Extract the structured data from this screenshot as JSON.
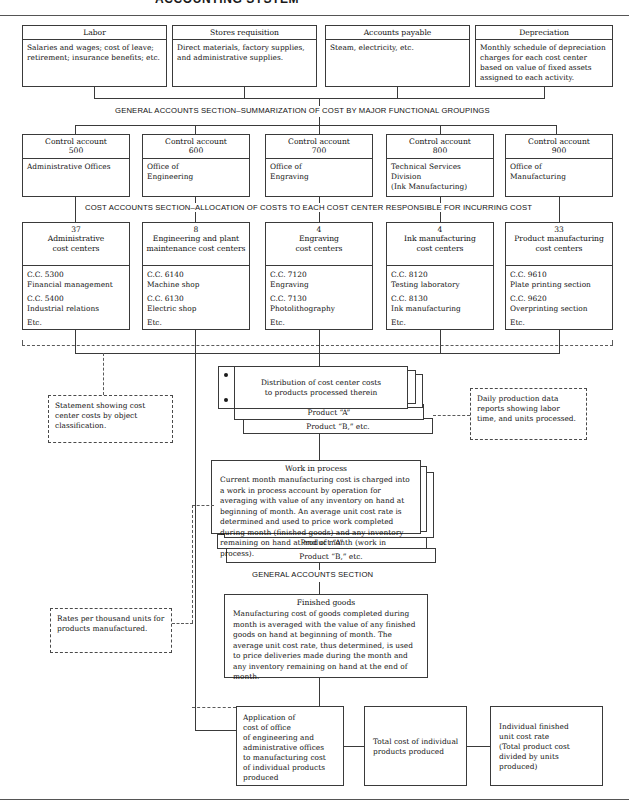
{
  "page": {
    "title_partial": "ACCOUNTING SYSTEM"
  },
  "source_documents": {
    "items": [
      {
        "header": "Labor",
        "body": "Salaries and wages; cost of leave; retirement; insurance benefits; etc."
      },
      {
        "header": "Stores requisition",
        "body": "Direct materials, factory supplies, and administrative supplies."
      },
      {
        "header": "Accounts payable",
        "body": "Steam, electricity, etc."
      },
      {
        "header": "Depreciation",
        "body": "Monthly schedule of depreciation charges for each cost center based on value of fixed assets assigned to each activity."
      }
    ]
  },
  "section_labels": {
    "general_accounts_top": "GENERAL ACCOUNTS SECTION–SUMMARIZATION OF COST BY MAJOR FUNCTIONAL GROUPINGS",
    "cost_accounts": "COST ACCOUNTS SECTION–ALLOCATION OF COSTS TO EACH COST CENTER RESPONSIBLE FOR INCURRING COST",
    "general_accounts_mid": "GENERAL ACCOUNTS SECTION"
  },
  "control_accounts": {
    "items": [
      {
        "header_line1": "Control account",
        "header_line2": "500",
        "body": "Administrative Offices"
      },
      {
        "header_line1": "Control account",
        "header_line2": "600",
        "body": "Office of\nEngineering"
      },
      {
        "header_line1": "Control account",
        "header_line2": "700",
        "body": "Office of\nEngraving"
      },
      {
        "header_line1": "Control account",
        "header_line2": "800",
        "body": "Technical Services\nDivision\n(Ink Manufacturing)"
      },
      {
        "header_line1": "Control account",
        "header_line2": "900",
        "body": "Office of\nManufacturing"
      }
    ]
  },
  "cost_centers": {
    "items": [
      {
        "count": "37",
        "name": "Administrative\ncost centers",
        "entries": [
          "C.C. 5300\nFinancial management",
          "C.C. 5400\nIndustrial relations",
          "Etc."
        ]
      },
      {
        "count": "8",
        "name": "Engineering and plant\nmaintenance cost centers",
        "entries": [
          "C.C. 6140\nMachine shop",
          "C.C. 6130\nElectric shop",
          "Etc."
        ]
      },
      {
        "count": "4",
        "name": "Engraving\ncost centers",
        "entries": [
          "C.C. 7120\nEngraving",
          "C.C. 7130\nPhotolithography",
          "Etc."
        ]
      },
      {
        "count": "4",
        "name": "Ink manufacturing\ncost centers",
        "entries": [
          "C.C. 8120\nTesting laboratory",
          "C.C. 8130\nInk manufacturing",
          "Etc."
        ]
      },
      {
        "count": "33",
        "name": "Product manufacturing\ncost centers",
        "entries": [
          "C.C. 9610\nPlate printing section",
          "C.C. 9620\nOverprinting section",
          "Etc."
        ]
      }
    ]
  },
  "distribution": {
    "card_text": "Distribution of cost center costs\nto products processed therein",
    "product_a": "Product “A”",
    "product_b": "Product “B,” etc."
  },
  "work_in_process": {
    "title": "Work in process",
    "body": "Current month manufacturing cost is charged into a work in process account by operation for averaging with value of any inventory on hand at beginning of month. An average unit cost rate is determined and used to price work completed during month (finished goods) and any inventory remaining on hand at end of month (work in process).",
    "product_a": "Product “A”",
    "product_b": "Product “B,” etc."
  },
  "finished_goods": {
    "title": "Finished goods",
    "body": "Manufacturing cost of goods completed during month is averaged with the value of any finished goods on hand at beginning of month. The average unit cost rate, thus determined, is used to price deliveries made during the month and any inventory remaining on hand at the end of month."
  },
  "side_notes": {
    "statement": "Statement showing cost center costs by object classification.",
    "daily_production": "Daily production data reports showing labor time, and units processed.",
    "rates": "Rates per thousand units for products manufactured."
  },
  "bottom_row": {
    "application": "Application of\ncost of office\nof engineering and\nadministrative offices\nto manufacturing cost\nof individual products\nproduced",
    "total_cost": "Total cost of individual\nproducts produced",
    "unit_rate": "Individual finished\nunit cost rate\n(Total product cost\ndivided by units\nproduced)"
  },
  "colors": {
    "line": "#3a3a3a",
    "dashed": "#5a5a5a",
    "rule": "#555555",
    "background": "#ffffff",
    "text": "#111111"
  }
}
